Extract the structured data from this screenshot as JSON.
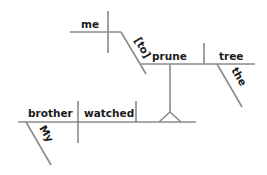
{
  "diagram": {
    "type": "sentence-diagram",
    "style": "Reed-Kellogg",
    "line_color": "#8a8a8a",
    "text_color": "#1a1a1a",
    "words": {
      "subject": "brother",
      "subject_modifier": "My",
      "verb": "watched",
      "infinitive_subject": "me",
      "infinitive_marker": "[to]",
      "infinitive_verb": "prune",
      "object": "tree",
      "object_modifier": "the"
    }
  }
}
